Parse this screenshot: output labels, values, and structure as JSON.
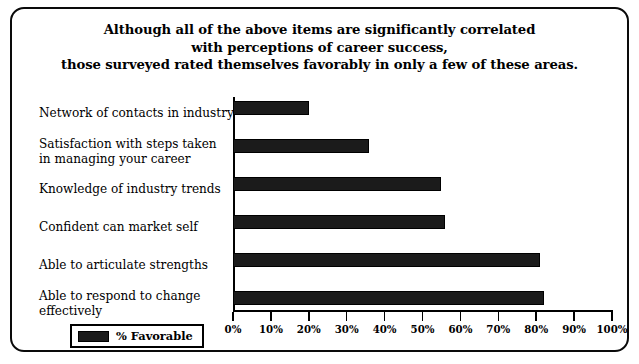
{
  "chart_data": {
    "type": "bar",
    "orientation": "horizontal",
    "title": "Although all of the above items are significantly correlated with perceptions of career success, those surveyed rated themselves favorably in only a few of these areas.",
    "title_lines": [
      "Although all of the above items are significantly correlated",
      "with perceptions of career success,",
      "those surveyed rated themselves favorably in only a few of these areas."
    ],
    "categories": [
      "Network of contacts in industry",
      "Satisfaction with steps taken\nin  managing your career",
      "Knowledge of industry trends",
      "Confident can market self",
      "Able to articulate strengths",
      "Able to respond to change\neffectively"
    ],
    "values": [
      20,
      36,
      55,
      56,
      81,
      82
    ],
    "series": [
      {
        "name": "% Favorable",
        "values": [
          20,
          36,
          55,
          56,
          81,
          82
        ]
      }
    ],
    "xlabel": "",
    "ylabel": "",
    "xlim": [
      0,
      100
    ],
    "xticks": [
      0,
      10,
      20,
      30,
      40,
      50,
      60,
      70,
      80,
      90,
      100
    ],
    "xtick_labels": [
      "0%",
      "10%",
      "20%",
      "30%",
      "40%",
      "50%",
      "60%",
      "70%",
      "80%",
      "90%",
      "100%"
    ],
    "grid": false,
    "legend_position": "bottom-left",
    "bar_color": "#1b1b1b"
  },
  "legend": {
    "label": "% Favorable"
  }
}
